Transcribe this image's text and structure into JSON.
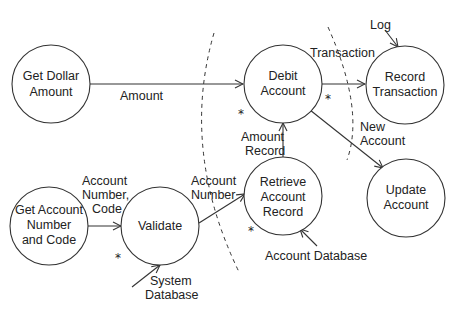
{
  "diagram": {
    "type": "data-flow-diagram",
    "nodes": [
      {
        "id": "get_dollar",
        "lines": [
          "Get Dollar",
          "Amount"
        ]
      },
      {
        "id": "debit",
        "lines": [
          "Debit",
          "Account"
        ]
      },
      {
        "id": "record_tx",
        "lines": [
          "Record",
          "Transaction"
        ]
      },
      {
        "id": "get_acct",
        "lines": [
          "Get Account",
          "Number",
          "and Code"
        ]
      },
      {
        "id": "validate",
        "lines": [
          "Validate"
        ]
      },
      {
        "id": "retrieve",
        "lines": [
          "Retrieve",
          "Account",
          "Record"
        ]
      },
      {
        "id": "update",
        "lines": [
          "Update",
          "Account"
        ]
      }
    ],
    "edges": [
      {
        "from": "get_dollar",
        "to": "debit",
        "label": [
          "Amount"
        ]
      },
      {
        "from": "debit",
        "to": "record_tx",
        "label": [
          "Transaction"
        ]
      },
      {
        "from": "external",
        "to": "record_tx",
        "label": [
          "Log"
        ]
      },
      {
        "from": "debit",
        "to": "update",
        "label": [
          "New",
          "Account"
        ]
      },
      {
        "from": "retrieve",
        "to": "debit",
        "label": [
          "Amount",
          "Record"
        ]
      },
      {
        "from": "get_acct",
        "to": "validate",
        "label": [
          "Account",
          "Number,",
          "Code"
        ]
      },
      {
        "from": "validate",
        "to": "retrieve",
        "label": [
          "Account",
          "Number"
        ]
      },
      {
        "from": "external",
        "to": "validate",
        "label": [
          "System",
          "Database"
        ]
      },
      {
        "from": "external",
        "to": "retrieve",
        "label": [
          "Account Database"
        ]
      }
    ],
    "star_marker": "*",
    "boundaries": 2
  }
}
